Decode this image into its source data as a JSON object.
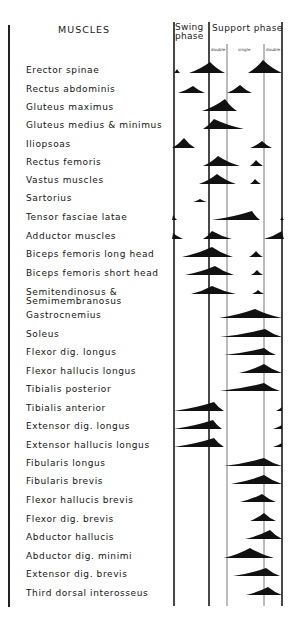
{
  "header": {
    "muscles_title": "MUSCLES",
    "swing_phase": [
      "Swing",
      "phase"
    ],
    "support_phase": "Support phase",
    "support_subphases": [
      "double",
      "single",
      "double"
    ]
  },
  "chart_data": {
    "type": "timeline",
    "xlabel": "Gait cycle phase",
    "x_divisions": [
      {
        "name": "Swing phase",
        "range": [
          0,
          32
        ]
      },
      {
        "name": "Support phase - double support",
        "range": [
          32,
          49
        ]
      },
      {
        "name": "Support phase - single support",
        "range": [
          49,
          82
        ]
      },
      {
        "name": "Support phase - double support",
        "range": [
          82,
          100
        ]
      }
    ],
    "x_px": {
      "left": 174,
      "swing_end": 209,
      "double1_end": 227,
      "single_end": 264,
      "right": 282
    },
    "rows": [
      {
        "muscle": "Erector spinae",
        "y": 70,
        "bursts": [
          [
            174,
            180,
            4,
            177
          ],
          [
            189,
            225,
            11,
            210
          ],
          [
            248,
            282,
            13,
            263
          ]
        ]
      },
      {
        "muscle": "Rectus abdominis",
        "y": 90,
        "bursts": [
          [
            178,
            205,
            7,
            193
          ],
          [
            227,
            252,
            8,
            240
          ]
        ]
      },
      {
        "muscle": "Gluteus maximus",
        "y": 108,
        "bursts": [
          [
            202,
            237,
            12,
            225
          ]
        ]
      },
      {
        "muscle": "Gluteus medius & minimus",
        "y": 126,
        "bursts": [
          [
            203,
            244,
            10,
            214
          ]
        ]
      },
      {
        "muscle": "Iliopsoas",
        "y": 145,
        "bursts": [
          [
            172,
            195,
            10,
            184
          ],
          [
            250,
            272,
            7,
            262
          ]
        ]
      },
      {
        "muscle": "Rectus femoris",
        "y": 163,
        "bursts": [
          [
            203,
            240,
            10,
            218
          ],
          [
            250,
            263,
            6,
            256
          ]
        ]
      },
      {
        "muscle": "Vastus muscles",
        "y": 181,
        "bursts": [
          [
            199,
            236,
            10,
            217
          ],
          [
            250,
            261,
            5,
            255
          ]
        ]
      },
      {
        "muscle": "Sartorius",
        "y": 199,
        "bursts": [
          [
            193,
            207,
            3,
            200
          ]
        ]
      },
      {
        "muscle": "Tensor fasciae latae",
        "y": 217,
        "bursts": [
          [
            172,
            177,
            5,
            173
          ],
          [
            212,
            260,
            9,
            252
          ],
          [
            280,
            284,
            3,
            282
          ]
        ]
      },
      {
        "muscle": "Adductor muscles",
        "y": 236,
        "bursts": [
          [
            172,
            183,
            6,
            173
          ],
          [
            203,
            232,
            8,
            212
          ],
          [
            264,
            284,
            8,
            282
          ]
        ]
      },
      {
        "muscle": "Biceps femoris long head",
        "y": 254,
        "bursts": [
          [
            182,
            233,
            10,
            212
          ],
          [
            249,
            263,
            6,
            256
          ]
        ]
      },
      {
        "muscle": "Biceps femoris short head",
        "y": 272,
        "bursts": [
          [
            185,
            234,
            9,
            215
          ],
          [
            251,
            263,
            5,
            257
          ]
        ]
      },
      {
        "muscle": "Semitendinosus & Semimembranosus",
        "y": 291,
        "bursts": [
          [
            191,
            236,
            8,
            212
          ],
          [
            252,
            264,
            4,
            258
          ]
        ]
      },
      {
        "muscle": "Gastrocnemius",
        "y": 315,
        "bursts": [
          [
            219,
            282,
            9,
            255
          ]
        ]
      },
      {
        "muscle": "Soleus",
        "y": 334,
        "bursts": [
          [
            220,
            282,
            8,
            265
          ]
        ]
      },
      {
        "muscle": "Flexor dig. longus",
        "y": 352,
        "bursts": [
          [
            224,
            276,
            7,
            264
          ]
        ]
      },
      {
        "muscle": "Flexor hallucis longus",
        "y": 370,
        "bursts": [
          [
            239,
            282,
            9,
            264
          ]
        ]
      },
      {
        "muscle": "Tibialis posterior",
        "y": 388,
        "bursts": [
          [
            220,
            280,
            8,
            264
          ]
        ]
      },
      {
        "muscle": "Tibialis anterior",
        "y": 408,
        "bursts": [
          [
            174,
            224,
            9,
            214
          ],
          [
            276,
            282,
            4,
            282
          ]
        ]
      },
      {
        "muscle": "Extensor dig. longus",
        "y": 426,
        "bursts": [
          [
            174,
            222,
            9,
            213
          ],
          [
            273,
            282,
            4,
            282
          ]
        ]
      },
      {
        "muscle": "Extensor hallucis longus",
        "y": 444,
        "bursts": [
          [
            174,
            224,
            9,
            214
          ],
          [
            273,
            282,
            4,
            282
          ]
        ]
      },
      {
        "muscle": "Fibularis longus",
        "y": 463,
        "bursts": [
          [
            224,
            282,
            8,
            264
          ]
        ]
      },
      {
        "muscle": "Fibularis brevis",
        "y": 481,
        "bursts": [
          [
            231,
            282,
            9,
            264
          ]
        ]
      },
      {
        "muscle": "Flexor hallucis brevis",
        "y": 499,
        "bursts": [
          [
            240,
            276,
            8,
            262
          ]
        ]
      },
      {
        "muscle": "Flexor dig. brevis",
        "y": 518,
        "bursts": [
          [
            250,
            276,
            8,
            264
          ]
        ]
      },
      {
        "muscle": "Abductor hallucis",
        "y": 536,
        "bursts": [
          [
            245,
            282,
            9,
            270
          ]
        ]
      },
      {
        "muscle": "Abductor dig. minimi",
        "y": 555,
        "bursts": [
          [
            224,
            274,
            10,
            250
          ]
        ]
      },
      {
        "muscle": "Extensor dig. brevis",
        "y": 573,
        "bursts": [
          [
            233,
            280,
            8,
            266
          ]
        ]
      },
      {
        "muscle": "Third dorsal interosseus",
        "y": 592,
        "bursts": [
          [
            246,
            282,
            8,
            268
          ]
        ]
      }
    ]
  },
  "labels": [
    {
      "text": "Erector spinae",
      "top": 66
    },
    {
      "text": "Rectus abdominis",
      "top": 85
    },
    {
      "text": "Gluteus maximus",
      "top": 103
    },
    {
      "text": "Gluteus medius  &  minimus",
      "top": 121
    },
    {
      "text": "Iliopsoas",
      "top": 140
    },
    {
      "text": "Rectus femoris",
      "top": 158
    },
    {
      "text": "Vastus muscles",
      "top": 176
    },
    {
      "text": "Sartorius",
      "top": 194
    },
    {
      "text": "Tensor fasciae latae",
      "top": 213
    },
    {
      "text": "Adductor muscles",
      "top": 232
    },
    {
      "text": "Biceps femoris long head",
      "top": 250
    },
    {
      "text": "Biceps femoris short head",
      "top": 269
    },
    {
      "text": "Semitendinosus  &",
      "top": 288
    },
    {
      "text": "Semimembranosus",
      "top": 297
    },
    {
      "text": "Gastrocnemius",
      "top": 311
    },
    {
      "text": "Soleus",
      "top": 330
    },
    {
      "text": "Flexor dig. longus",
      "top": 348
    },
    {
      "text": "Flexor hallucis longus",
      "top": 367
    },
    {
      "text": "Tibialis posterior",
      "top": 385
    },
    {
      "text": "Tibialis anterior",
      "top": 404
    },
    {
      "text": "Extensor dig. longus",
      "top": 422
    },
    {
      "text": "Extensor hallucis longus",
      "top": 441
    },
    {
      "text": "Fibularis longus",
      "top": 459
    },
    {
      "text": "Fibularis brevis",
      "top": 477
    },
    {
      "text": "Flexor hallucis brevis",
      "top": 496
    },
    {
      "text": "Flexor dig. brevis",
      "top": 515
    },
    {
      "text": "Abductor hallucis",
      "top": 533
    },
    {
      "text": "Abductor dig. minimi",
      "top": 552
    },
    {
      "text": "Extensor dig. brevis",
      "top": 570
    },
    {
      "text": "Third dorsal interosseus",
      "top": 589
    }
  ],
  "colors": {
    "ink": "#111111",
    "grid": "#555555",
    "background": "#ffffff"
  }
}
